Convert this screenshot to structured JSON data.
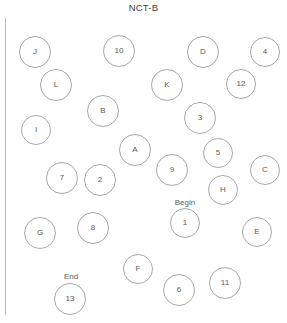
{
  "title": "NCT-B",
  "colors": {
    "background": "#ffffff",
    "node_stroke": "#a8a8a8",
    "text": "#5a5a5a",
    "title_text": "#3f3f3f",
    "rule": "#b9b9b9"
  },
  "canvas": {
    "width": 287,
    "height": 323
  },
  "markers": [
    {
      "name": "begin-marker",
      "label": "Begin",
      "x": 185,
      "y": 203
    },
    {
      "name": "end-marker",
      "label": "End",
      "x": 71,
      "y": 277
    }
  ],
  "nodes": [
    {
      "label": "J",
      "x": 35,
      "y": 52,
      "r": 16
    },
    {
      "label": "10",
      "x": 119,
      "y": 51,
      "r": 16
    },
    {
      "label": "D",
      "x": 203,
      "y": 52,
      "r": 16
    },
    {
      "label": "4",
      "x": 265,
      "y": 52,
      "r": 15
    },
    {
      "label": "L",
      "x": 56,
      "y": 85,
      "r": 16
    },
    {
      "label": "K",
      "x": 167,
      "y": 85,
      "r": 16
    },
    {
      "label": "12",
      "x": 241,
      "y": 84,
      "r": 15
    },
    {
      "label": "B",
      "x": 103,
      "y": 111,
      "r": 16
    },
    {
      "label": "3",
      "x": 200,
      "y": 118,
      "r": 16
    },
    {
      "label": "I",
      "x": 36,
      "y": 130,
      "r": 15
    },
    {
      "label": "A",
      "x": 135,
      "y": 150,
      "r": 16
    },
    {
      "label": "5",
      "x": 218,
      "y": 153,
      "r": 15
    },
    {
      "label": "C",
      "x": 265,
      "y": 170,
      "r": 15
    },
    {
      "label": "9",
      "x": 172,
      "y": 170,
      "r": 16
    },
    {
      "label": "7",
      "x": 62,
      "y": 178,
      "r": 16
    },
    {
      "label": "2",
      "x": 100,
      "y": 180,
      "r": 16
    },
    {
      "label": "H",
      "x": 223,
      "y": 190,
      "r": 15
    },
    {
      "label": "1",
      "x": 185,
      "y": 223,
      "r": 15
    },
    {
      "label": "G",
      "x": 40,
      "y": 233,
      "r": 16
    },
    {
      "label": "8",
      "x": 93,
      "y": 228,
      "r": 16
    },
    {
      "label": "E",
      "x": 257,
      "y": 232,
      "r": 15
    },
    {
      "label": "F",
      "x": 138,
      "y": 269,
      "r": 15
    },
    {
      "label": "13",
      "x": 70,
      "y": 299,
      "r": 16
    },
    {
      "label": "6",
      "x": 179,
      "y": 290,
      "r": 16
    },
    {
      "label": "11",
      "x": 225,
      "y": 283,
      "r": 16
    }
  ]
}
